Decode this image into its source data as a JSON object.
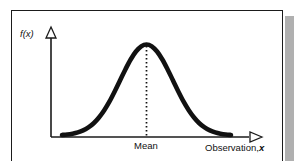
{
  "figure": {
    "kind": "normal-distribution-diagram",
    "frame_color": "#1b1b1b",
    "shadow_color": "#9a9a9a",
    "background": "#ffffff"
  },
  "labels": {
    "y_axis": "f(x)",
    "x_axis_text": "Observation,",
    "x_axis_variable": "x",
    "mean": "Mean"
  },
  "chart_data": {
    "type": "line",
    "title": "",
    "subtitle": "",
    "xlabel": "Observation, x",
    "ylabel": "f(x)",
    "grid": false,
    "legend": "none",
    "annotations": [
      {
        "name": "mean-line",
        "label": "Mean",
        "style": "dotted-vertical",
        "x": 0.0,
        "y_from": 0.0,
        "y_to": 1.0
      }
    ],
    "axis_arrows": {
      "x": "open-triangle-right",
      "y": "open-triangle-up"
    },
    "xlim": [
      -3.2,
      3.2
    ],
    "ylim": [
      0,
      1.12
    ],
    "x_ticks": [],
    "y_ticks": [],
    "series": [
      {
        "name": "probability density",
        "curve": "gaussian",
        "mean": 0,
        "sigma": 1,
        "peak_value": 1.0,
        "stroke": "#111111",
        "x": [
          -3.2,
          -3.0,
          -2.8,
          -2.6,
          -2.4,
          -2.2,
          -2.0,
          -1.8,
          -1.6,
          -1.4,
          -1.2,
          -1.0,
          -0.8,
          -0.6,
          -0.4,
          -0.2,
          0.0,
          0.2,
          0.4,
          0.6,
          0.8,
          1.0,
          1.2,
          1.4,
          1.6,
          1.8,
          2.0,
          2.2,
          2.4,
          2.6,
          2.8,
          3.0,
          3.2
        ],
        "values": [
          0.006,
          0.011,
          0.02,
          0.034,
          0.056,
          0.089,
          0.135,
          0.198,
          0.278,
          0.375,
          0.487,
          0.607,
          0.726,
          0.835,
          0.923,
          0.98,
          1.0,
          0.98,
          0.923,
          0.835,
          0.726,
          0.607,
          0.487,
          0.375,
          0.278,
          0.198,
          0.135,
          0.089,
          0.056,
          0.034,
          0.02,
          0.011,
          0.006
        ]
      }
    ]
  }
}
